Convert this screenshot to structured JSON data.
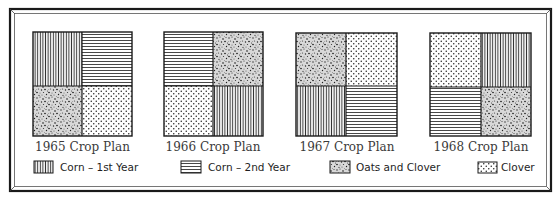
{
  "plans": [
    {
      "label": "1965 Crop Plan",
      "quadrants": {
        "top_left": "corn1",
        "top_right": "corn2",
        "bottom_left": "oats",
        "bottom_right": "clover"
      }
    },
    {
      "label": "1966 Crop Plan",
      "quadrants": {
        "top_left": "corn2",
        "top_right": "oats",
        "bottom_left": "clover",
        "bottom_right": "corn1"
      }
    },
    {
      "label": "1967 Crop Plan",
      "quadrants": {
        "top_left": "oats",
        "top_right": "clover",
        "bottom_left": "corn1",
        "bottom_right": "corn2"
      }
    },
    {
      "label": "1968 Crop Plan",
      "quadrants": {
        "top_left": "clover",
        "top_right": "corn1",
        "bottom_left": "corn2",
        "bottom_right": "oats"
      }
    }
  ],
  "legend": [
    {
      "key": "corn1",
      "label": "Corn – 1st Year",
      "pattern": "vertical-lines"
    },
    {
      "key": "corn2",
      "label": "Corn – 2nd Year",
      "pattern": "horizontal-lines"
    },
    {
      "key": "oats",
      "label": "Oats and Clover",
      "pattern": "stipple"
    },
    {
      "key": "clover",
      "label": "Clover",
      "pattern": "dots"
    }
  ],
  "colors": {
    "ink": "#1a1a1a",
    "paper": "#ffffff"
  }
}
